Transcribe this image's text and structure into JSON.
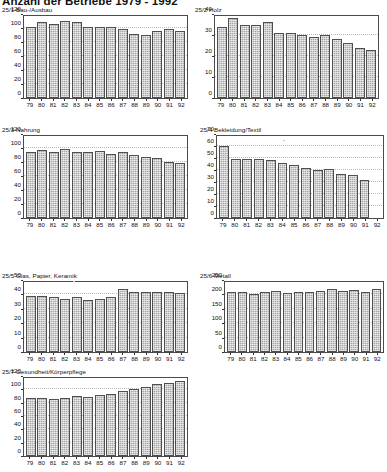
{
  "page": {
    "title": "Anzahl der Betriebe 1979 - 1992"
  },
  "chart_data": [
    {
      "id": "bau-ausbau",
      "type": "bar",
      "title": "25/1 Bau-/Ausbau",
      "categories": [
        "79",
        "80",
        "81",
        "82",
        "83",
        "84",
        "85",
        "86",
        "87",
        "88",
        "89",
        "90",
        "91",
        "92"
      ],
      "values": [
        102,
        108,
        106,
        110,
        108,
        102,
        101,
        102,
        99,
        91,
        90,
        96,
        98,
        96
      ],
      "xlabel": "",
      "ylabel": "",
      "ylim": [
        0,
        120
      ],
      "yticks": [
        0,
        20,
        40,
        60,
        80,
        100,
        120
      ],
      "grid": true,
      "legend": "none"
    },
    {
      "id": "holz",
      "type": "bar",
      "title": "25/2 Holz",
      "categories": [
        "79",
        "80",
        "81",
        "82",
        "83",
        "84",
        "85",
        "86",
        "87",
        "88",
        "89",
        "90",
        "91",
        "92"
      ],
      "values": [
        34,
        38,
        35,
        35,
        36,
        31,
        31,
        30,
        29,
        30,
        28,
        26,
        24,
        23
      ],
      "xlabel": "",
      "ylabel": "",
      "ylim": [
        0,
        40
      ],
      "yticks": [
        0,
        10,
        20,
        30,
        40
      ],
      "grid": true,
      "legend": "none"
    },
    {
      "id": "nahrung",
      "type": "bar",
      "title": "25/3 Nahrung",
      "categories": [
        "79",
        "80",
        "81",
        "82",
        "83",
        "84",
        "85",
        "86",
        "87",
        "88",
        "89",
        "90",
        "91",
        "92"
      ],
      "values": [
        95,
        97,
        95,
        98,
        94,
        94,
        96,
        91,
        94,
        90,
        87,
        86,
        80,
        79
      ],
      "xlabel": "",
      "ylabel": "",
      "ylim": [
        0,
        120
      ],
      "yticks": [
        0,
        20,
        40,
        60,
        80,
        100,
        120
      ],
      "grid": true,
      "legend": "none"
    },
    {
      "id": "bekleidung-textil",
      "type": "bar",
      "title": "25/4 Bekleidung/Textil",
      "categories": [
        "79",
        "80",
        "81",
        "82",
        "83",
        "84",
        "85",
        "86",
        "87",
        "88",
        "89",
        "90",
        "91",
        "92"
      ],
      "values": [
        60,
        49,
        49,
        49,
        48,
        46,
        44,
        42,
        40,
        41,
        37,
        36,
        32,
        0
      ],
      "xlabel": "",
      "ylabel": "",
      "ylim": [
        0,
        70
      ],
      "yticks": [
        0,
        10,
        20,
        30,
        40,
        50,
        60,
        70
      ],
      "grid": true,
      "legend": "none"
    },
    {
      "id": "glas-papier-keramik",
      "type": "bar",
      "title": "25/5 Glas, Papier, Keramik",
      "categories": [
        "79",
        "80",
        "81",
        "82",
        "83",
        "84",
        "85",
        "86",
        "87",
        "88",
        "89",
        "90",
        "91",
        "92"
      ],
      "values": [
        39,
        39,
        38,
        37,
        38,
        36,
        37,
        38,
        44,
        42,
        42,
        42,
        42,
        41
      ],
      "xlabel": "",
      "ylabel": "",
      "ylim": [
        0,
        50
      ],
      "yticks": [
        0,
        10,
        20,
        30,
        40,
        50
      ],
      "grid": true,
      "legend": "none"
    },
    {
      "id": "metall",
      "type": "bar",
      "title": "25/6 Metall",
      "categories": [
        "79",
        "80",
        "81",
        "82",
        "83",
        "84",
        "85",
        "86",
        "87",
        "88",
        "89",
        "90",
        "91",
        "92"
      ],
      "values": [
        207,
        210,
        203,
        208,
        212,
        204,
        210,
        210,
        212,
        219,
        212,
        214,
        210,
        218
      ],
      "xlabel": "",
      "ylabel": "",
      "ylim": [
        0,
        250
      ],
      "yticks": [
        0,
        50,
        100,
        150,
        200,
        250
      ],
      "grid": true,
      "legend": "none"
    },
    {
      "id": "gesundheit-koerperpflege",
      "type": "bar",
      "title": "25/7 Gesundheit/Körperpflege",
      "categories": [
        "79",
        "80",
        "81",
        "82",
        "83",
        "84",
        "85",
        "86",
        "87",
        "88",
        "89",
        "90",
        "91",
        "92"
      ],
      "values": [
        87,
        87,
        85,
        87,
        90,
        89,
        92,
        93,
        98,
        100,
        104,
        108,
        109,
        112
      ],
      "xlabel": "",
      "ylabel": "",
      "ylim": [
        0,
        120
      ],
      "yticks": [
        0,
        20,
        40,
        60,
        80,
        100,
        120
      ],
      "grid": true,
      "legend": "none"
    }
  ],
  "layout": {
    "panels": [
      {
        "x": 2,
        "y": 6,
        "plotX": 21,
        "plotY": 9,
        "plotW": 165,
        "plotH": 84
      },
      {
        "x": 195,
        "y": 6,
        "plotX": 19,
        "plotY": 9,
        "plotW": 165,
        "plotH": 84
      },
      {
        "x": 2,
        "y": 126,
        "plotX": 21,
        "plotY": 9,
        "plotW": 165,
        "plotH": 84
      },
      {
        "x": 200,
        "y": 126,
        "plotX": 16,
        "plotY": 9,
        "plotW": 168,
        "plotH": 84
      },
      {
        "x": 2,
        "y": 272,
        "plotX": 21,
        "plotY": 9,
        "plotW": 165,
        "plotH": 72
      },
      {
        "x": 200,
        "y": 272,
        "plotX": 24,
        "plotY": 9,
        "plotW": 160,
        "plotH": 72
      },
      {
        "x": 2,
        "y": 368,
        "plotX": 21,
        "plotY": 9,
        "plotW": 165,
        "plotH": 80
      }
    ]
  }
}
